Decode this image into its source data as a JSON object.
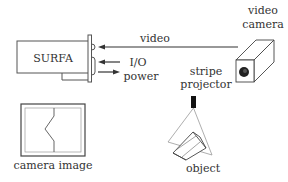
{
  "diagram": {
    "surfa": {
      "label": "SURFA"
    },
    "links": {
      "video": "video",
      "io": "I/O",
      "power": "power"
    },
    "camera": {
      "label_line1": "video",
      "label_line2": "camera"
    },
    "projector": {
      "label_line1": "stripe",
      "label_line2": "projector"
    },
    "object": {
      "label": "object"
    },
    "camera_image": {
      "label": "camera image"
    }
  },
  "colors": {
    "stroke": "#333333",
    "light_stroke": "#999999",
    "background": "#ffffff"
  }
}
